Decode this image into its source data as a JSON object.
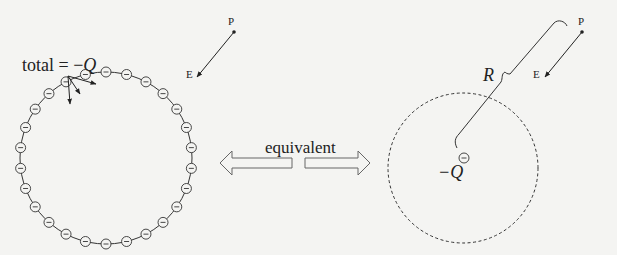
{
  "left_panel": {
    "total_label": "total = −Q",
    "total_prefix": "total = −",
    "total_symbol": "Q",
    "point_label": "P",
    "field_label": "E",
    "charge_sign": "−",
    "charge_count": 26,
    "shell_center": [
      106,
      158
    ],
    "shell_radius": 86
  },
  "middle": {
    "label": "equivalent"
  },
  "right_panel": {
    "point_label": "P",
    "field_label": "E",
    "distance_label": "R",
    "charge_label": "−Q",
    "charge_sign": "−",
    "sphere_center": [
      463,
      168
    ],
    "sphere_radius": 75
  },
  "colors": {
    "ink": "#222222",
    "background": "#f4f4f2"
  }
}
